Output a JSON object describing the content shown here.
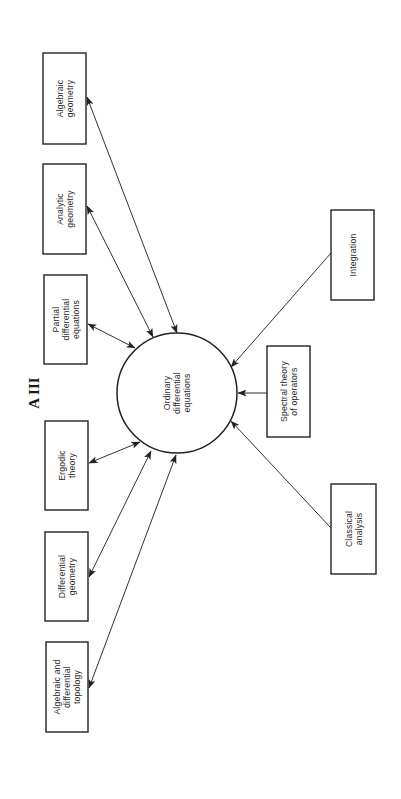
{
  "figure": {
    "label": "A III",
    "orientation": "rotated -90 degrees (page rotated counter-clockwise)"
  },
  "hub": {
    "id": "ode",
    "lines": [
      "Ordinary",
      "differential",
      "equations"
    ],
    "cx": 177,
    "cy": 393,
    "r": 60
  },
  "nodes": [
    {
      "id": "algebraic-geometry",
      "lines": [
        "Algebraic",
        "geometry"
      ],
      "x": 43,
      "y": 53,
      "w": 43,
      "h": 91
    },
    {
      "id": "analytic-geometry",
      "lines": [
        "Analytic",
        "geometry"
      ],
      "x": 43,
      "y": 164,
      "w": 43,
      "h": 90
    },
    {
      "id": "partial-differential-equations",
      "lines": [
        "Partial",
        "differential",
        "equations"
      ],
      "x": 44,
      "y": 275,
      "w": 43,
      "h": 89
    },
    {
      "id": "ergodic-theory",
      "lines": [
        "Ergodic",
        "theory"
      ],
      "x": 45,
      "y": 421,
      "w": 43,
      "h": 89
    },
    {
      "id": "differential-geometry",
      "lines": [
        "Differential",
        "geometry"
      ],
      "x": 45,
      "y": 532,
      "w": 43,
      "h": 89
    },
    {
      "id": "algebraic-differential-topology",
      "lines": [
        "Algebraic and",
        "differential",
        "topology"
      ],
      "x": 46,
      "y": 642,
      "w": 42,
      "h": 90
    },
    {
      "id": "integration",
      "lines": [
        "Integration"
      ],
      "x": 331,
      "y": 210,
      "w": 43,
      "h": 90
    },
    {
      "id": "spectral-theory-of-operators",
      "lines": [
        "Spectral theory",
        "of operators"
      ],
      "x": 267,
      "y": 346,
      "w": 43,
      "h": 91
    },
    {
      "id": "classical-analysis",
      "lines": [
        "Classical",
        "analysis"
      ],
      "x": 331,
      "y": 484,
      "w": 45,
      "h": 90
    }
  ],
  "edges": [
    {
      "from": "algebraic-geometry",
      "to": "ode",
      "type": "bidirectional",
      "x1": 87,
      "y1": 97,
      "x2": 177,
      "y2": 333
    },
    {
      "from": "analytic-geometry",
      "to": "ode",
      "type": "bidirectional",
      "x1": 87,
      "y1": 206,
      "x2": 153,
      "y2": 337
    },
    {
      "from": "partial-differential-equations",
      "to": "ode",
      "type": "bidirectional",
      "x1": 88,
      "y1": 324,
      "x2": 135,
      "y2": 348
    },
    {
      "from": "ergodic-theory",
      "to": "ode",
      "type": "bidirectional",
      "x1": 89,
      "y1": 463,
      "x2": 140,
      "y2": 442
    },
    {
      "from": "differential-geometry",
      "to": "ode",
      "type": "bidirectional",
      "x1": 89,
      "y1": 577,
      "x2": 151,
      "y2": 451
    },
    {
      "from": "algebraic-differential-topology",
      "to": "ode",
      "type": "bidirectional",
      "x1": 89,
      "y1": 688,
      "x2": 176,
      "y2": 455
    },
    {
      "from": "integration",
      "to": "ode",
      "type": "directed",
      "x1": 331,
      "y1": 253,
      "x2": 231,
      "y2": 367
    },
    {
      "from": "spectral-theory-of-operators",
      "to": "ode",
      "type": "directed",
      "x1": 267,
      "y1": 393,
      "x2": 238,
      "y2": 393
    },
    {
      "from": "classical-analysis",
      "to": "ode",
      "type": "directed",
      "x1": 331,
      "y1": 528,
      "x2": 231,
      "y2": 421
    }
  ],
  "title_pos": {
    "x": 34,
    "y": 393
  },
  "colors": {
    "stroke": "#222222",
    "background": "#fefefe",
    "text": "#2a2a2a"
  }
}
